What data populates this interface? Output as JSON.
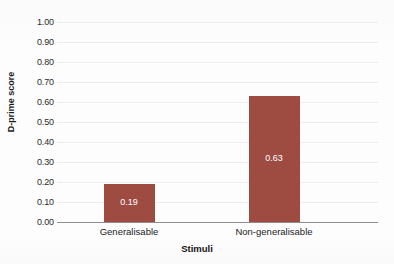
{
  "chart_data": {
    "type": "bar",
    "title": "",
    "subtitle": "",
    "xlabel": "Stimuli",
    "ylabel": "D-prime score",
    "categories": [
      "Generalisable",
      "Non-generalisable"
    ],
    "values": [
      0.19,
      0.63
    ],
    "value_labels": [
      "0.19",
      "0.63"
    ],
    "ylim": [
      0.0,
      1.0
    ],
    "ytick_step": 0.1,
    "ytick_labels": [
      "1.00",
      "0.90",
      "0.80",
      "0.70",
      "0.60",
      "0.50",
      "0.40",
      "0.30",
      "0.20",
      "0.10",
      "0.00"
    ],
    "ytick_values": [
      1.0,
      0.9,
      0.8,
      0.7,
      0.6,
      0.5,
      0.4,
      0.3,
      0.2,
      0.1,
      0.0
    ],
    "grid": true,
    "grid_axis": "y",
    "legend": false,
    "legend_position": "none",
    "bar_color": "#9e4b42",
    "value_label_color": "#ffffff",
    "gridline_color": "#ededed",
    "axis_line_color": "#8d8d8d",
    "background_color": "#fdfdfd",
    "text_color": "#1c1c1c"
  }
}
